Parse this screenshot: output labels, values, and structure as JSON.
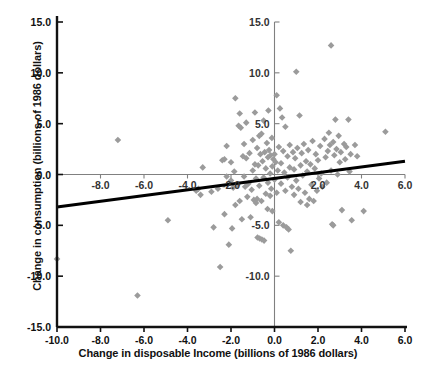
{
  "chart_data": {
    "type": "scatter",
    "title": "",
    "xlabel": "Change in disposable Income (billions of 1986 dollars)",
    "ylabel": "Change in consumption (billions of 1986 dollars)",
    "xlim": [
      -10.0,
      6.0
    ],
    "ylim": [
      -15.0,
      15.0
    ],
    "grid": false,
    "legend": null,
    "marker": {
      "shape": "diamond",
      "color": "#9b9b9b",
      "size": 5
    },
    "outer_x_ticks": [
      "-10.0",
      "-8.0",
      "-6.0",
      "-4.0",
      "-2.0",
      "0.0",
      "2.0",
      "4.0",
      "6.0"
    ],
    "outer_x_tick_values": [
      -10.0,
      -8.0,
      -6.0,
      -4.0,
      -2.0,
      0.0,
      2.0,
      4.0,
      6.0
    ],
    "outer_y_ticks": [
      "15.0",
      "10.0",
      "5.0",
      "0.0",
      "-5.0",
      "-10.0",
      "-15.0"
    ],
    "outer_y_tick_values": [
      15.0,
      10.0,
      5.0,
      0.0,
      -5.0,
      -10.0,
      -15.0
    ],
    "inner_x_ticks": [
      "-8.0",
      "-6.0",
      "-4.0",
      "-2.0",
      "2.0",
      "4.0",
      "6.0"
    ],
    "inner_x_tick_values": [
      -8.0,
      -6.0,
      -4.0,
      -2.0,
      2.0,
      4.0,
      6.0
    ],
    "inner_y_ticks": [
      "15.0",
      "10.0",
      "5.0",
      "-5.0",
      "-10.0"
    ],
    "inner_y_tick_values": [
      15.0,
      10.0,
      5.0,
      -5.0,
      -10.0
    ],
    "trendline": {
      "x": [
        -10.0,
        6.0
      ],
      "y": [
        -3.2,
        1.3
      ],
      "color": "#000000",
      "width": 3
    },
    "axis_color": "#111111",
    "inner_axis_color": "#808080",
    "points": [
      [
        -10.0,
        -8.3
      ],
      [
        -7.2,
        3.4
      ],
      [
        -6.3,
        -11.9
      ],
      [
        -4.9,
        -4.5
      ],
      [
        -3.6,
        -1.6
      ],
      [
        -3.5,
        -1.4
      ],
      [
        -3.4,
        -2.0
      ],
      [
        -3.3,
        0.7
      ],
      [
        -2.9,
        -1.7
      ],
      [
        -2.8,
        -5.2
      ],
      [
        -2.6,
        -1.4
      ],
      [
        -2.5,
        -9.1
      ],
      [
        -2.4,
        1.4
      ],
      [
        -2.3,
        1.5
      ],
      [
        -2.3,
        -3.9
      ],
      [
        -2.2,
        -0.2
      ],
      [
        -2.2,
        2.8
      ],
      [
        -2.1,
        -6.9
      ],
      [
        -2.0,
        -0.6
      ],
      [
        -2.0,
        1.2
      ],
      [
        -1.95,
        -5.3
      ],
      [
        -1.9,
        -1.3
      ],
      [
        -1.85,
        0.3
      ],
      [
        -1.8,
        7.5
      ],
      [
        -1.8,
        -3.0
      ],
      [
        -1.7,
        -1.0
      ],
      [
        -1.65,
        4.8
      ],
      [
        -1.6,
        6.0
      ],
      [
        -1.6,
        -2.6
      ],
      [
        -1.55,
        4.6
      ],
      [
        -1.5,
        -4.4
      ],
      [
        -1.45,
        1.8
      ],
      [
        -1.4,
        3.0
      ],
      [
        -1.4,
        -0.2
      ],
      [
        -1.35,
        -1.2
      ],
      [
        -1.3,
        5.1
      ],
      [
        -1.3,
        1.6
      ],
      [
        -1.25,
        -2.2
      ],
      [
        -1.2,
        -0.9
      ],
      [
        -1.15,
        2.1
      ],
      [
        -1.1,
        -4.2
      ],
      [
        -1.05,
        -1.5
      ],
      [
        -1.0,
        3.4
      ],
      [
        -1.0,
        0.4
      ],
      [
        -0.95,
        -2.5
      ],
      [
        -0.9,
        1.0
      ],
      [
        -0.9,
        6.1
      ],
      [
        -0.85,
        -0.4
      ],
      [
        -0.85,
        -2.8
      ],
      [
        -0.8,
        2.6
      ],
      [
        -0.8,
        -2.4
      ],
      [
        -0.78,
        -6.2
      ],
      [
        -0.75,
        0.9
      ],
      [
        -0.7,
        3.8
      ],
      [
        -0.7,
        -1.1
      ],
      [
        -0.68,
        -6.3
      ],
      [
        -0.65,
        2.0
      ],
      [
        -0.6,
        -2.6
      ],
      [
        -0.6,
        4.0
      ],
      [
        -0.58,
        -6.4
      ],
      [
        -0.55,
        1.3
      ],
      [
        -0.5,
        -0.3
      ],
      [
        -0.5,
        5.3
      ],
      [
        -0.48,
        -6.5
      ],
      [
        -0.45,
        2.2
      ],
      [
        -0.4,
        -1.9
      ],
      [
        -0.4,
        0.6
      ],
      [
        -0.35,
        3.1
      ],
      [
        -0.32,
        -3.4
      ],
      [
        -0.3,
        1.7
      ],
      [
        -0.3,
        -0.8
      ],
      [
        -0.28,
        6.3
      ],
      [
        -0.25,
        2.4
      ],
      [
        -0.2,
        -2.1
      ],
      [
        -0.2,
        0.1
      ],
      [
        -0.18,
        1.9
      ],
      [
        -0.15,
        -1.4
      ],
      [
        -0.12,
        3.6
      ],
      [
        -0.1,
        0.8
      ],
      [
        -0.1,
        -3.6
      ],
      [
        -0.05,
        1.5
      ],
      [
        0.0,
        2.0
      ],
      [
        0.0,
        -0.5
      ],
      [
        0.05,
        1.2
      ],
      [
        0.1,
        7.8
      ],
      [
        0.1,
        -1.8
      ],
      [
        0.15,
        0.4
      ],
      [
        0.2,
        2.7
      ],
      [
        0.2,
        -4.7
      ],
      [
        0.25,
        6.5
      ],
      [
        0.3,
        1.1
      ],
      [
        0.3,
        -0.9
      ],
      [
        0.35,
        5.6
      ],
      [
        0.4,
        -5.0
      ],
      [
        0.4,
        2.3
      ],
      [
        0.45,
        0.2
      ],
      [
        0.5,
        -1.6
      ],
      [
        0.5,
        4.7
      ],
      [
        0.55,
        -5.2
      ],
      [
        0.6,
        1.8
      ],
      [
        0.6,
        -0.3
      ],
      [
        0.65,
        -5.4
      ],
      [
        0.7,
        2.9
      ],
      [
        0.7,
        0.7
      ],
      [
        0.75,
        -7.5
      ],
      [
        0.8,
        -1.2
      ],
      [
        0.85,
        2.2
      ],
      [
        0.9,
        0.5
      ],
      [
        0.9,
        -2.0
      ],
      [
        0.95,
        1.6
      ],
      [
        1.0,
        10.1
      ],
      [
        1.0,
        -0.6
      ],
      [
        1.05,
        2.6
      ],
      [
        1.1,
        -1.4
      ],
      [
        1.15,
        5.8
      ],
      [
        1.2,
        0.9
      ],
      [
        1.2,
        -2.7
      ],
      [
        1.25,
        2.1
      ],
      [
        1.3,
        -0.1
      ],
      [
        1.35,
        3.0
      ],
      [
        1.4,
        -1.8
      ],
      [
        1.45,
        1.3
      ],
      [
        1.5,
        -3.0
      ],
      [
        1.5,
        0.3
      ],
      [
        1.55,
        2.4
      ],
      [
        1.6,
        -2.4
      ],
      [
        1.65,
        1.0
      ],
      [
        1.7,
        -1.0
      ],
      [
        1.75,
        3.3
      ],
      [
        1.8,
        -2.6
      ],
      [
        1.85,
        0.6
      ],
      [
        1.9,
        2.0
      ],
      [
        1.95,
        -1.6
      ],
      [
        2.0,
        1.4
      ],
      [
        2.05,
        -0.4
      ],
      [
        2.1,
        2.8
      ],
      [
        2.15,
        0.1
      ],
      [
        2.2,
        -1.2
      ],
      [
        2.3,
        3.5
      ],
      [
        2.35,
        1.7
      ],
      [
        2.4,
        -0.8
      ],
      [
        2.45,
        2.3
      ],
      [
        2.5,
        4.1
      ],
      [
        2.55,
        2.9
      ],
      [
        2.6,
        12.7
      ],
      [
        2.6,
        0.4
      ],
      [
        2.65,
        -4.9
      ],
      [
        2.7,
        3.2
      ],
      [
        2.7,
        -5.0
      ],
      [
        2.75,
        1.9
      ],
      [
        2.8,
        5.4
      ],
      [
        2.85,
        2.5
      ],
      [
        2.9,
        0.0
      ],
      [
        2.95,
        3.8
      ],
      [
        3.0,
        1.2
      ],
      [
        3.05,
        2.2
      ],
      [
        3.1,
        -3.5
      ],
      [
        3.2,
        3.0
      ],
      [
        3.25,
        1.5
      ],
      [
        3.3,
        2.7
      ],
      [
        3.4,
        5.4
      ],
      [
        3.45,
        0.3
      ],
      [
        3.5,
        2.0
      ],
      [
        3.55,
        -4.5
      ],
      [
        3.7,
        2.9
      ],
      [
        3.8,
        1.8
      ],
      [
        4.1,
        -3.6
      ],
      [
        5.1,
        4.2
      ]
    ]
  }
}
